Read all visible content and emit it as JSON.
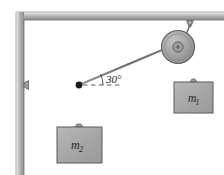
{
  "figure": {
    "name": "pulley-two-mass-statics-diagram",
    "angle_label": "30°",
    "mass1_label": "m",
    "mass1_sub": "1",
    "mass2_label": "m",
    "mass2_sub": "2",
    "colors": {
      "wall": "#b0b0b0",
      "wall_edge": "#6f6f6f",
      "block_fill": "#a8a8a8",
      "block_edge": "#5a5a5a",
      "pulley_fill": "#a6a6a6",
      "pulley_edge": "#5f5f5f",
      "pulley_hub": "#8f8f8f",
      "rope": "#6b6b6b",
      "knot": "#1a1a1a",
      "dashed": "#4a4a4a",
      "text": "#1a1a1a",
      "background": "#ffffff"
    },
    "elements": {
      "ceiling": "horizontal-ceiling-beam",
      "left_wall": "vertical-wall",
      "wall_anchor": "wall-anchor-bracket",
      "knot": "rope-junction-knot",
      "dashed_reference": "horizontal-dashed-reference-line",
      "angle_arc": "angle-arc-30-degrees",
      "pulley": "ceiling-pulley",
      "pulley_bracket": "pulley-ceiling-bracket",
      "rope_horizontal": "horizontal-rope-wall-to-knot",
      "rope_incline": "inclined-rope-knot-to-pulley",
      "rope_mass1": "vertical-rope-pulley-to-mass1",
      "rope_mass2": "vertical-rope-knot-to-mass2",
      "block_mass1": "hanging-block-mass1",
      "block_mass2": "hanging-block-mass2",
      "hook_mass1": "block-hook-mass1",
      "hook_mass2": "block-hook-mass2"
    }
  }
}
